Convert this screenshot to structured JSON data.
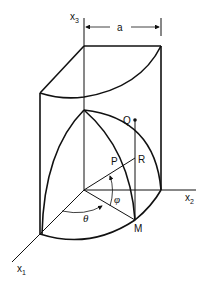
{
  "diagram": {
    "type": "3d-geometry",
    "axes": {
      "x1": {
        "label": "x",
        "subscript": "1"
      },
      "x2": {
        "label": "x",
        "subscript": "2"
      },
      "x3": {
        "label": "x",
        "subscript": "3"
      }
    },
    "dimension_label": "a",
    "points": {
      "Q": "Q",
      "P": "P",
      "R": "R",
      "M": "M"
    },
    "angles": {
      "theta": "θ",
      "phi": "φ"
    },
    "colors": {
      "line": "#111111",
      "background": "#ffffff"
    }
  }
}
